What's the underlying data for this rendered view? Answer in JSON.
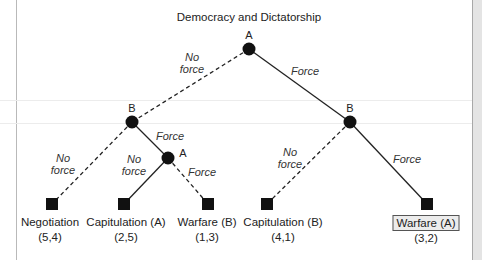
{
  "title": "Democracy and Dictatorship",
  "players": {
    "a": "A",
    "b": "B"
  },
  "branches": {
    "root_no_force": [
      "No",
      "force"
    ],
    "root_force": "Force",
    "bleft_no_force": [
      "No",
      "force"
    ],
    "bleft_force": "Force",
    "ainner_no_force": [
      "No",
      "force"
    ],
    "ainner_force": "Force",
    "bright_no_force": [
      "No",
      "force"
    ],
    "bright_force": "Force"
  },
  "outcomes": [
    {
      "name": "Negotiation",
      "payoff": "(5,4)",
      "highlighted": false
    },
    {
      "name": "Capitulation (A)",
      "payoff": "(2,5)",
      "highlighted": false
    },
    {
      "name": "Warfare (B)",
      "payoff": "(1,3)",
      "highlighted": false
    },
    {
      "name": "Capitulation (B)",
      "payoff": "(4,1)",
      "highlighted": false
    },
    {
      "name": "Warfare (A)",
      "payoff": "(3,2)",
      "highlighted": true
    }
  ],
  "colors": {
    "node": "#111111",
    "line": "#222222",
    "highlight_fill": "#ececec"
  }
}
